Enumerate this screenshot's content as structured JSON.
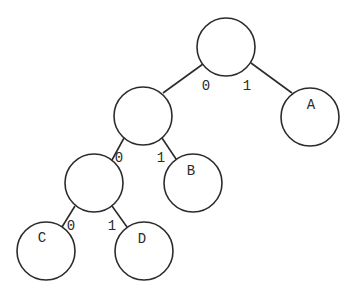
{
  "diagram": {
    "type": "binary-tree",
    "nodes": [
      {
        "id": "root",
        "label": "",
        "cx": 226,
        "cy": 47,
        "r": 29
      },
      {
        "id": "n1",
        "label": "",
        "cx": 143,
        "cy": 116,
        "r": 29
      },
      {
        "id": "A",
        "label": "A",
        "cx": 310,
        "cy": 117,
        "r": 29
      },
      {
        "id": "n2",
        "label": "",
        "cx": 94,
        "cy": 183,
        "r": 29
      },
      {
        "id": "B",
        "label": "B",
        "cx": 193,
        "cy": 183,
        "r": 29
      },
      {
        "id": "C",
        "label": "C",
        "cx": 46,
        "cy": 251,
        "r": 29
      },
      {
        "id": "D",
        "label": "D",
        "cx": 144,
        "cy": 251,
        "r": 29
      }
    ],
    "edges": [
      {
        "from": "root",
        "to": "n1",
        "label": "0",
        "x1": 203,
        "y1": 64,
        "x2": 163,
        "y2": 93,
        "lx": 205,
        "ly": 90
      },
      {
        "from": "root",
        "to": "A",
        "label": "1",
        "x1": 251,
        "y1": 63,
        "x2": 292,
        "y2": 93,
        "lx": 245,
        "ly": 90
      },
      {
        "from": "n1",
        "to": "n2",
        "label": "0",
        "x1": 124,
        "y1": 138,
        "x2": 112,
        "y2": 160,
        "lx": 116,
        "ly": 162
      },
      {
        "from": "n1",
        "to": "B",
        "label": "1",
        "x1": 162,
        "y1": 138,
        "x2": 176,
        "y2": 159,
        "lx": 156,
        "ly": 162
      },
      {
        "from": "n2",
        "to": "C",
        "label": "0",
        "x1": 75,
        "y1": 206,
        "x2": 62,
        "y2": 227,
        "lx": 67,
        "ly": 230
      },
      {
        "from": "n2",
        "to": "D",
        "label": "1",
        "x1": 112,
        "y1": 206,
        "x2": 127,
        "y2": 227,
        "lx": 107,
        "ly": 230
      }
    ],
    "labels": {
      "A": "A",
      "B": "B",
      "C": "C",
      "D": "D",
      "edge_root_left": "0",
      "edge_root_right": "1",
      "edge_n1_left": "0",
      "edge_n1_right": "1",
      "edge_n2_left": "0",
      "edge_n2_right": "1"
    }
  }
}
